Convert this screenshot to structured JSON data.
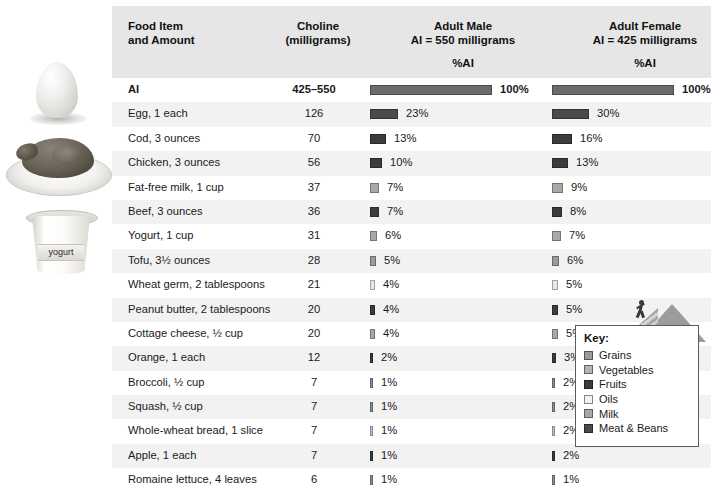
{
  "header": {
    "col_food": "Food Item\nand Amount",
    "col_food_l1": "Food Item",
    "col_food_l2": "and Amount",
    "col_choline_l1": "Choline",
    "col_choline_l2": "(milligrams)",
    "col_male_l1": "Adult Male",
    "col_male_l2": "AI = 550 milligrams",
    "col_female_l1": "Adult Female",
    "col_female_l2": "AI = 425 milligrams",
    "sub_male": "%AI",
    "sub_female": "%AI"
  },
  "legend": {
    "title": "Key:",
    "items": [
      {
        "label": "Grains",
        "color": "#9a9a9a"
      },
      {
        "label": "Vegetables",
        "color": "#b4b4b4"
      },
      {
        "label": "Fruits",
        "color": "#3c3c3c"
      },
      {
        "label": "Oils",
        "color": "#f2f2f2"
      },
      {
        "label": "Milk",
        "color": "#a8a8a8"
      },
      {
        "label": "Meat & Beans",
        "color": "#4a4a4a"
      }
    ]
  },
  "photos": {
    "egg": "egg-photo",
    "chicken": "roast-chicken-photo",
    "yogurt": "yogurt-container-photo",
    "yogurt_label": "yogurt"
  },
  "chart_data": {
    "type": "bar",
    "categories": [
      "AI",
      "Egg, 1 each",
      "Cod, 3 ounces",
      "Chicken, 3 ounces",
      "Fat-free milk, 1 cup",
      "Beef, 3 ounces",
      "Yogurt, 1 cup",
      "Tofu, 3½ ounces",
      "Wheat germ, 2 tablespoons",
      "Peanut butter, 2 tablespoons",
      "Cottage cheese, ½ cup",
      "Orange, 1 each",
      "Broccoli, ½ cup",
      "Squash, ½ cup",
      "Whole-wheat bread, 1 slice",
      "Apple, 1 each",
      "Romaine lettuce, 4 leaves"
    ],
    "choline_mg": [
      "425–550",
      "126",
      "70",
      "56",
      "37",
      "36",
      "31",
      "28",
      "21",
      "20",
      "20",
      "12",
      "7",
      "7",
      "7",
      "7",
      "6"
    ],
    "series": [
      {
        "name": "Adult Male %AI",
        "values": [
          100,
          23,
          13,
          10,
          7,
          7,
          6,
          5,
          4,
          4,
          4,
          2,
          1,
          1,
          1,
          1,
          1
        ]
      },
      {
        "name": "Adult Female %AI",
        "values": [
          100,
          30,
          16,
          13,
          9,
          8,
          7,
          6,
          5,
          5,
          5,
          3,
          2,
          2,
          2,
          2,
          1
        ]
      }
    ],
    "xlabel": "%AI",
    "ylabel": "",
    "xlim": [
      0,
      100
    ],
    "grid": false,
    "legend_position": "bottom-right"
  },
  "rows": [
    {
      "name": "AI",
      "value": "425–550",
      "male_pct": 100,
      "female_pct": 100,
      "male_label": "100%",
      "female_label": "100%",
      "group": "ai",
      "color": "#6b6b6b"
    },
    {
      "name": "Egg, 1 each",
      "value": "126",
      "male_pct": 23,
      "female_pct": 30,
      "male_label": "23%",
      "female_label": "30%",
      "group": "Meat & Beans",
      "color": "#4a4a4a"
    },
    {
      "name": "Cod, 3 ounces",
      "value": "70",
      "male_pct": 13,
      "female_pct": 16,
      "male_label": "13%",
      "female_label": "16%",
      "group": "Meat & Beans",
      "color": "#3c3c3c"
    },
    {
      "name": "Chicken, 3 ounces",
      "value": "56",
      "male_pct": 10,
      "female_pct": 13,
      "male_label": "10%",
      "female_label": "13%",
      "group": "Meat & Beans",
      "color": "#3c3c3c"
    },
    {
      "name": "Fat-free milk, 1 cup",
      "value": "37",
      "male_pct": 7,
      "female_pct": 9,
      "male_label": "7%",
      "female_label": "9%",
      "group": "Milk",
      "color": "#a8a8a8"
    },
    {
      "name": "Beef, 3 ounces",
      "value": "36",
      "male_pct": 7,
      "female_pct": 8,
      "male_label": "7%",
      "female_label": "8%",
      "group": "Meat & Beans",
      "color": "#3c3c3c"
    },
    {
      "name": "Yogurt, 1 cup",
      "value": "31",
      "male_pct": 6,
      "female_pct": 7,
      "male_label": "6%",
      "female_label": "7%",
      "group": "Milk",
      "color": "#a8a8a8"
    },
    {
      "name": "Tofu, 3½ ounces",
      "value": "28",
      "male_pct": 5,
      "female_pct": 6,
      "male_label": "5%",
      "female_label": "6%",
      "group": "Meat & Beans",
      "color": "#9a9a9a"
    },
    {
      "name": "Wheat germ, 2 tablespoons",
      "value": "21",
      "male_pct": 4,
      "female_pct": 5,
      "male_label": "4%",
      "female_label": "5%",
      "group": "Grains",
      "color": "#e8e8e8"
    },
    {
      "name": "Peanut butter, 2 tablespoons",
      "value": "20",
      "male_pct": 4,
      "female_pct": 5,
      "male_label": "4%",
      "female_label": "5%",
      "group": "Meat & Beans",
      "color": "#3c3c3c"
    },
    {
      "name": "Cottage cheese, ½ cup",
      "value": "20",
      "male_pct": 4,
      "female_pct": 5,
      "male_label": "4%",
      "female_label": "5%",
      "group": "Milk",
      "color": "#a8a8a8"
    },
    {
      "name": "Orange, 1 each",
      "value": "12",
      "male_pct": 2,
      "female_pct": 3,
      "male_label": "2%",
      "female_label": "3%",
      "group": "Fruits",
      "color": "#3c3c3c"
    },
    {
      "name": "Broccoli, ½ cup",
      "value": "7",
      "male_pct": 1,
      "female_pct": 2,
      "male_label": "1%",
      "female_label": "2%",
      "group": "Vegetables",
      "color": "#8f8f8f"
    },
    {
      "name": "Squash, ½ cup",
      "value": "7",
      "male_pct": 1,
      "female_pct": 2,
      "male_label": "1%",
      "female_label": "2%",
      "group": "Vegetables",
      "color": "#8f8f8f"
    },
    {
      "name": "Whole-wheat bread, 1 slice",
      "value": "7",
      "male_pct": 1,
      "female_pct": 2,
      "male_label": "1%",
      "female_label": "2%",
      "group": "Grains",
      "color": "#c4c4c4"
    },
    {
      "name": "Apple, 1 each",
      "value": "7",
      "male_pct": 1,
      "female_pct": 2,
      "male_label": "1%",
      "female_label": "2%",
      "group": "Fruits",
      "color": "#3c3c3c"
    },
    {
      "name": "Romaine lettuce, 4 leaves",
      "value": "6",
      "male_pct": 1,
      "female_pct": 1,
      "male_label": "1%",
      "female_label": "1%",
      "group": "Vegetables",
      "color": "#8f8f8f"
    }
  ]
}
